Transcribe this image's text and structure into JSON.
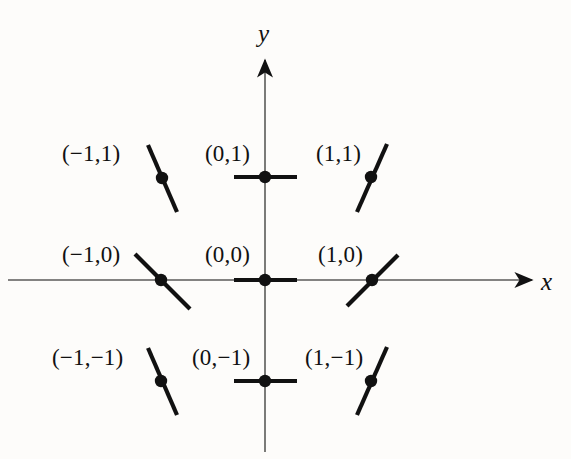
{
  "figure": {
    "background_color": "#fdfcfa",
    "ink_color": "#111111",
    "axis_color": "#4a4a4a"
  },
  "axes": {
    "x_label": "x",
    "y_label": "y",
    "x_label_pos": {
      "x": 541,
      "y": 268
    },
    "y_label_pos": {
      "x": 258,
      "y": 20
    },
    "origin": {
      "x": 265,
      "y": 280
    },
    "x_start": {
      "x": 8,
      "y": 280
    },
    "x_end": {
      "x": 532,
      "y": 280
    },
    "y_start": {
      "x": 265,
      "y": 452
    },
    "y_end": {
      "x": 265,
      "y": 60
    },
    "arrowheads": [
      "x-positive",
      "y-positive"
    ]
  },
  "chart_data": {
    "type": "scatter",
    "xlabel": "x",
    "ylabel": "y",
    "grid": false,
    "legend": null,
    "xlim": [
      -1.7,
      1.7
    ],
    "ylim": [
      -1.7,
      1.7
    ],
    "x": [
      -1,
      0,
      1,
      -1,
      0,
      1,
      -1,
      0,
      1
    ],
    "y": [
      1,
      1,
      1,
      0,
      0,
      0,
      -1,
      -1,
      -1
    ],
    "points": [
      {
        "name": "point-neg1-1",
        "label": "(−1,1)",
        "x": -1,
        "y": 1,
        "slope": -2.3,
        "slope_sign": "negative-steep",
        "px": {
          "x": 162,
          "y": 178
        },
        "seg": {
          "x1": 148,
          "y1": 145,
          "x2": 177,
          "y2": 212
        },
        "label_pos": {
          "x": 62,
          "y": 141
        }
      },
      {
        "name": "point-0-1",
        "label": "(0,1)",
        "x": 0,
        "y": 1,
        "slope": 0,
        "slope_sign": "zero",
        "px": {
          "x": 265,
          "y": 177
        },
        "seg": {
          "x1": 234,
          "y1": 177,
          "x2": 297,
          "y2": 177
        },
        "label_pos": {
          "x": 205,
          "y": 141
        }
      },
      {
        "name": "point-1-1",
        "label": "(1,1)",
        "x": 1,
        "y": 1,
        "slope": 2.3,
        "slope_sign": "positive-steep",
        "px": {
          "x": 371,
          "y": 177
        },
        "seg": {
          "x1": 357,
          "y1": 212,
          "x2": 387,
          "y2": 144
        },
        "label_pos": {
          "x": 316,
          "y": 141
        }
      },
      {
        "name": "point-neg1-0",
        "label": "(−1,0)",
        "x": -1,
        "y": 0,
        "slope": -1,
        "slope_sign": "negative",
        "px": {
          "x": 161,
          "y": 280
        },
        "seg": {
          "x1": 135,
          "y1": 254,
          "x2": 190,
          "y2": 309
        },
        "label_pos": {
          "x": 62,
          "y": 242
        }
      },
      {
        "name": "point-0-0",
        "label": "(0,0)",
        "x": 0,
        "y": 0,
        "slope": 0,
        "slope_sign": "zero",
        "px": {
          "x": 265,
          "y": 280
        },
        "seg": {
          "x1": 234,
          "y1": 280,
          "x2": 297,
          "y2": 280
        },
        "label_pos": {
          "x": 205,
          "y": 242
        }
      },
      {
        "name": "point-1-0",
        "label": "(1,0)",
        "x": 1,
        "y": 0,
        "slope": 1,
        "slope_sign": "positive",
        "px": {
          "x": 372,
          "y": 280
        },
        "seg": {
          "x1": 347,
          "y1": 306,
          "x2": 398,
          "y2": 255
        },
        "label_pos": {
          "x": 318,
          "y": 242
        }
      },
      {
        "name": "point-neg1-neg1",
        "label": "(−1,−1)",
        "x": -1,
        "y": -1,
        "slope": -2.3,
        "slope_sign": "negative-steep",
        "px": {
          "x": 161,
          "y": 381
        },
        "seg": {
          "x1": 148,
          "y1": 348,
          "x2": 177,
          "y2": 415
        },
        "label_pos": {
          "x": 52,
          "y": 345
        }
      },
      {
        "name": "point-0-neg1",
        "label": "(0,−1)",
        "x": 0,
        "y": -1,
        "slope": 0,
        "slope_sign": "zero",
        "px": {
          "x": 265,
          "y": 381
        },
        "seg": {
          "x1": 234,
          "y1": 381,
          "x2": 297,
          "y2": 381
        },
        "label_pos": {
          "x": 192,
          "y": 345
        }
      },
      {
        "name": "point-1-neg1",
        "label": "(1,−1)",
        "x": 1,
        "y": -1,
        "slope": 2.3,
        "slope_sign": "positive-steep",
        "px": {
          "x": 371,
          "y": 381
        },
        "seg": {
          "x1": 357,
          "y1": 415,
          "x2": 387,
          "y2": 347
        },
        "label_pos": {
          "x": 305,
          "y": 345
        }
      }
    ]
  }
}
